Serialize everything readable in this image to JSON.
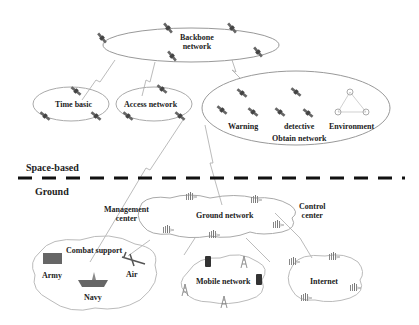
{
  "diagram": {
    "type": "space-ground integrated network architecture",
    "colors": {
      "stroke": "#999999",
      "text": "#222222",
      "divider": "#111111",
      "satellite": "#555555",
      "tower": "#777777"
    },
    "space": {
      "label": "Space-based",
      "backbone": {
        "label_line1": "Backbone",
        "label_line2": "network"
      },
      "time_basic": {
        "label": "Time basic"
      },
      "access": {
        "label": "Access network"
      },
      "obtain": {
        "label": "Obtain network",
        "items": [
          "Warning",
          "detective",
          "Environment"
        ]
      }
    },
    "ground": {
      "label": "Ground",
      "ground_network": {
        "label": "Ground network"
      },
      "management": {
        "label_line1": "Management",
        "label_line2": "center"
      },
      "control": {
        "label_line1": "Control",
        "label_line2": "center"
      },
      "combat": {
        "label": "Combat support",
        "items": [
          "Army",
          "Navy",
          "Air"
        ]
      },
      "mobile": {
        "label": "Mobile network"
      },
      "internet": {
        "label": "Internet"
      }
    }
  }
}
